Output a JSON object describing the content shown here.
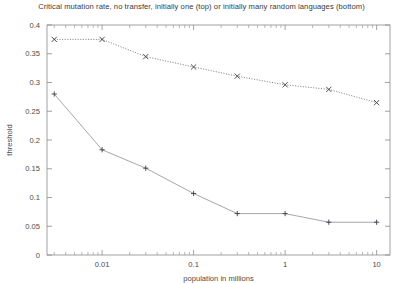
{
  "chart_data": {
    "type": "line",
    "title": "Critical mutation rate, no transfer, initially one (top) or initially many random languages (bottom)",
    "xlabel": "population in millions",
    "ylabel": "threshold",
    "xscale": "log",
    "yscale": "linear",
    "xlim": [
      0.0025,
      14
    ],
    "ylim": [
      0,
      0.4
    ],
    "grid": false,
    "legend": "none",
    "xticks": [
      0.01,
      0.1,
      1,
      10
    ],
    "xtick_labels": [
      "0.01",
      "0.1",
      "1",
      "10"
    ],
    "yticks": [
      0,
      0.05,
      0.1,
      0.15,
      0.2,
      0.25,
      0.3,
      0.35,
      0.4
    ],
    "ytick_labels": [
      "0",
      "0.05",
      "0.1",
      "0.15",
      "0.2",
      "0.25",
      "0.3",
      "0.35",
      "0.4"
    ],
    "x": [
      0.003,
      0.01,
      0.03,
      0.1,
      0.3,
      1,
      3,
      10
    ],
    "series": [
      {
        "name": "initially one language (top)",
        "marker": "x",
        "linestyle": "dotted",
        "color": "#6e6e7a",
        "values": [
          0.375,
          0.375,
          0.345,
          0.327,
          0.311,
          0.296,
          0.288,
          0.265
        ]
      },
      {
        "name": "initially many random languages (bottom)",
        "marker": "+",
        "linestyle": "solid",
        "color": "#9b9ba8",
        "values": [
          0.28,
          0.183,
          0.151,
          0.107,
          0.072,
          0.072,
          0.057,
          0.057
        ]
      }
    ]
  }
}
